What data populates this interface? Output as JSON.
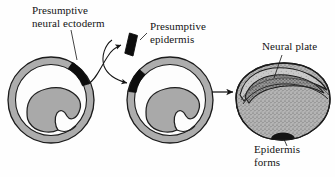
{
  "figure": {
    "background_color": "#fefefe",
    "line_color": "#141414",
    "tissue_dark_color": "#0d0d0d",
    "ring_fill_color": "#adadad",
    "interior_fill_color": "#a9a9a9",
    "stipple_fill_color": "#9c9c9c"
  },
  "labels": {
    "neural_ectoderm": "Presumptive\nneural ectoderm",
    "presumptive_epidermis": "Presumptive\nepidermis",
    "neural_plate": "Neural plate",
    "epidermis_forms": "Epidermis\nforms"
  },
  "panels": [
    {
      "id": "donor-embryo",
      "name": "Donor embryo cross-section",
      "dark_segment_position": "upper-right",
      "dark_segment_label": "Presumptive neural ectoderm"
    },
    {
      "id": "host-embryo",
      "name": "Host embryo cross-section after graft",
      "dark_segment_position": "upper-left",
      "dark_segment_label": "Grafted presumptive neural ectoderm"
    },
    {
      "id": "excised-tissue",
      "name": "Excised tissue fragment",
      "dark_segment_label": "Presumptive epidermis"
    },
    {
      "id": "result-embryo",
      "name": "Resulting embryo with neural plate",
      "features": [
        "Neural plate",
        "Epidermis forms"
      ]
    }
  ],
  "arrows": [
    {
      "id": "excise-arrow",
      "from": "donor-embryo",
      "to": "excised-tissue",
      "style": "curved"
    },
    {
      "id": "graft-arrow",
      "from": "excised-tissue",
      "to": "host-embryo",
      "style": "curved"
    },
    {
      "id": "develop-arrow",
      "from": "host-embryo",
      "to": "result-embryo",
      "style": "straight"
    }
  ]
}
